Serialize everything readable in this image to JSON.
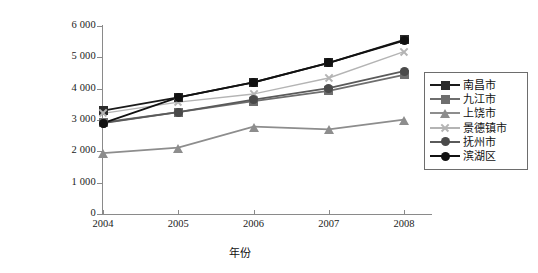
{
  "chart_data": {
    "type": "line",
    "title": "",
    "xlabel": "年份",
    "ylabel": "农村居民人均纯收入/元",
    "categories": [
      "2004",
      "2005",
      "2006",
      "2007",
      "2008"
    ],
    "x": [
      2004,
      2005,
      2006,
      2007,
      2008
    ],
    "ylim": [
      0,
      6000
    ],
    "ytick_labels": [
      "6 000",
      "5 000",
      "4 000",
      "3 000",
      "2 000",
      "1 000",
      "0"
    ],
    "ytick_values": [
      6000,
      5000,
      4000,
      3000,
      2000,
      1000,
      0
    ],
    "grid": false,
    "legend_position": "right",
    "series": [
      {
        "name": "南昌市",
        "values": [
          3300,
          3720,
          4200,
          4820,
          5560
        ],
        "color": "#1a1a1a",
        "marker": "square",
        "marker_fill": "#2b2b2b"
      },
      {
        "name": "九江市",
        "values": [
          2920,
          3250,
          3600,
          3930,
          4440
        ],
        "color": "#6e6e6e",
        "marker": "square",
        "marker_fill": "#6e6e6e"
      },
      {
        "name": "上饶市",
        "values": [
          1940,
          2120,
          2790,
          2700,
          3010
        ],
        "color": "#8d8d8d",
        "marker": "triangle",
        "marker_fill": "#8d8d8d"
      },
      {
        "name": "景德镇市",
        "values": [
          3210,
          3570,
          3830,
          4340,
          5180
        ],
        "color": "#b4b4b4",
        "marker": "x",
        "marker_fill": "#b4b4b4"
      },
      {
        "name": "抚州市",
        "values": [
          2900,
          3250,
          3650,
          4020,
          4560
        ],
        "color": "#5a5a5a",
        "marker": "circle",
        "marker_fill": "#4a4a4a"
      },
      {
        "name": "滨湖区",
        "values": [
          2900,
          3720,
          4200,
          4820,
          5530
        ],
        "color": "#111111",
        "marker": "circle",
        "marker_fill": "#111111"
      }
    ]
  }
}
